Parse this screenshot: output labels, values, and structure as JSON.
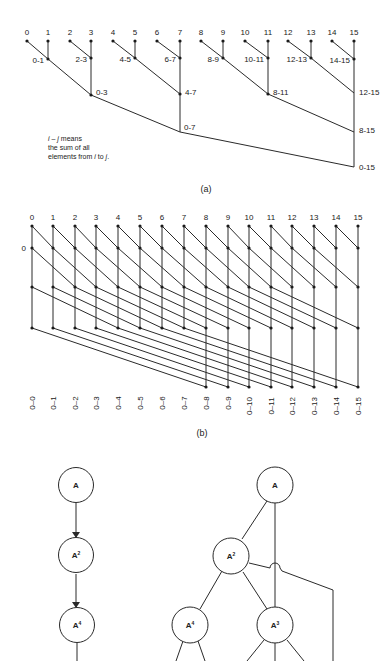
{
  "diagram_a": {
    "caption": "(a)",
    "inputs": [
      "0",
      "1",
      "2",
      "3",
      "4",
      "5",
      "6",
      "7",
      "8",
      "9",
      "10",
      "11",
      "12",
      "13",
      "14",
      "15"
    ],
    "level1": [
      "0-1",
      "2-3",
      "4-5",
      "6-7",
      "8-9",
      "10-11",
      "12-13",
      "14-15"
    ],
    "level2": [
      "0-3",
      "4-7",
      "8-11",
      "12-15"
    ],
    "level3": [
      "0-7",
      "8-15"
    ],
    "level4": [
      "0-15"
    ],
    "note": {
      "line1_italic_i": "i",
      "line1_dash": " – ",
      "line1_italic_j": "j",
      "line1_rest": " means",
      "line2": "the sum of all",
      "line3_pre": "elements from ",
      "line3_i": "i",
      "line3_mid": " to ",
      "line3_j": "j",
      "line3_end": "."
    }
  },
  "diagram_b": {
    "caption": "(b)",
    "inputs": [
      "0",
      "1",
      "2",
      "3",
      "4",
      "5",
      "6",
      "7",
      "8",
      "9",
      "10",
      "11",
      "12",
      "13",
      "14",
      "15"
    ],
    "side_label": "0",
    "outputs": [
      "0–0",
      "0–1",
      "0–2",
      "0–3",
      "0–4",
      "0–5",
      "0–6",
      "0–7",
      "0–8",
      "0–9",
      "0–10",
      "0–11",
      "0–12",
      "0–13",
      "0–14",
      "0–15"
    ]
  },
  "diagram_c": {
    "left_chain": [
      "A",
      "A",
      "A"
    ],
    "left_chain_exp": [
      "",
      "2",
      "4"
    ],
    "right_tree": {
      "root": {
        "base": "A",
        "exp": ""
      },
      "a2": {
        "base": "A",
        "exp": "2"
      },
      "a4": {
        "base": "A",
        "exp": "4"
      },
      "a3": {
        "base": "A",
        "exp": "3"
      }
    }
  }
}
